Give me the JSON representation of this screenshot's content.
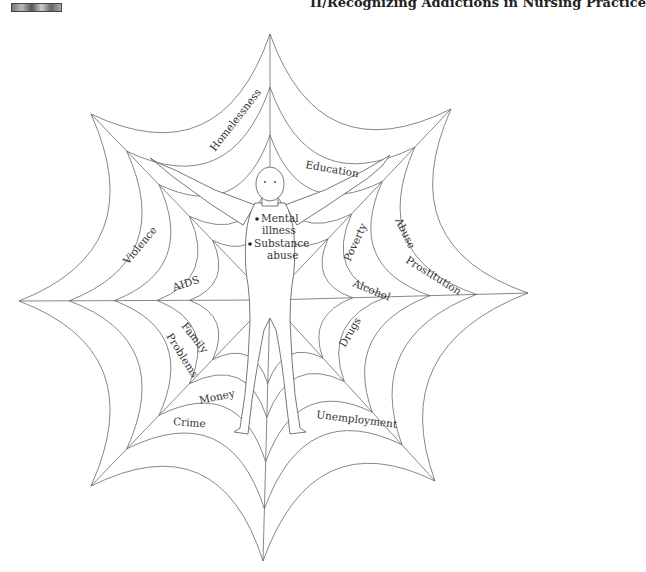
{
  "header": {
    "running_head": "II/Recognizing Addictions in Nursing Practice"
  },
  "figure": {
    "center": [
      270,
      300
    ],
    "tips": [
      [
        270,
        34
      ],
      [
        451,
        109
      ],
      [
        528,
        293
      ],
      [
        435,
        481
      ],
      [
        263,
        561
      ],
      [
        91,
        486
      ],
      [
        19,
        301
      ],
      [
        91,
        114
      ]
    ],
    "ring_fractions": [
      1.0,
      0.8,
      0.62,
      0.45,
      0.32
    ],
    "arc_sag": 0.45,
    "center_labels": [
      "Mental illness",
      "Substance abuse"
    ],
    "labels": [
      {
        "text": "Homelessness",
        "x": 215,
        "y": 152,
        "rot": -52
      },
      {
        "text": "Education",
        "x": 305,
        "y": 168,
        "rot": 10
      },
      {
        "text": "Abuse",
        "x": 395,
        "y": 220,
        "rot": 64
      },
      {
        "text": "Prostitution",
        "x": 405,
        "y": 262,
        "rot": 32
      },
      {
        "text": "Poverty",
        "x": 350,
        "y": 262,
        "rot": -65
      },
      {
        "text": "Alcohol",
        "x": 352,
        "y": 286,
        "rot": 22
      },
      {
        "text": "Violence",
        "x": 128,
        "y": 265,
        "rot": -50
      },
      {
        "text": "AIDS",
        "x": 174,
        "y": 291,
        "rot": -18
      },
      {
        "text": "Drugs",
        "x": 345,
        "y": 348,
        "rot": -60
      },
      {
        "text": "Family",
        "x": 181,
        "y": 326,
        "rot": 52
      },
      {
        "text": "Problems",
        "x": 166,
        "y": 336,
        "rot": 58
      },
      {
        "text": "Money",
        "x": 200,
        "y": 404,
        "rot": -12
      },
      {
        "text": "Crime",
        "x": 173,
        "y": 425,
        "rot": 4
      },
      {
        "text": "Unemployment",
        "x": 316,
        "y": 418,
        "rot": 7
      }
    ]
  }
}
